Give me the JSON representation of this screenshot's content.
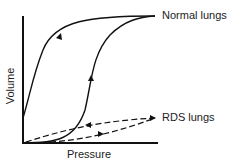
{
  "diagram": {
    "xlabel": "Pressure",
    "ylabel": "Volume",
    "curves": [
      {
        "name": "Normal lungs",
        "style": "solid",
        "type": "hysteresis loop"
      },
      {
        "name": "RDS lungs",
        "style": "dashed",
        "type": "hysteresis loop"
      }
    ],
    "colors": {
      "line": "#111111",
      "text": "#222222",
      "background": "#ffffff"
    }
  }
}
